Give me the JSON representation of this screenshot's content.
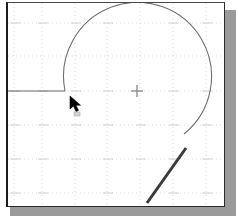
{
  "window": {
    "title": "CAD Drawing Area",
    "background_color": "#ffffff",
    "border_color": "#1c1c1c",
    "shadow_color": "#9a9a9a"
  },
  "grid": {
    "label": "construction-grid",
    "color": "#d9d9d9",
    "style": "dotted",
    "visible": true,
    "vertical_positions": [
      12,
      40,
      73,
      105,
      138,
      171,
      204
    ],
    "horizontal_positions": [
      22,
      55,
      90,
      124,
      158,
      192
    ]
  },
  "geometry": {
    "arc": {
      "name": "circular-arc",
      "color": "#6e6e6e",
      "stroke_width": 1,
      "center_x": 136,
      "center_y": 90,
      "radius": 74,
      "start_angle_deg": 180,
      "end_angle_deg": 45
    },
    "horizontal_line": {
      "name": "horizontal-construction-line",
      "color": "#6a6a6a",
      "stroke_width": 1,
      "x1": 5,
      "y1": 90,
      "x2": 63,
      "y2": 90
    },
    "diagonal_line": {
      "name": "diagonal-line",
      "color": "#3a3a3a",
      "stroke_width": 3,
      "x1": 145,
      "y1": 201,
      "x2": 184,
      "y2": 147
    },
    "center_marker": {
      "name": "center-crosshair-marker",
      "color": "#8f8f8f",
      "x": 135,
      "y": 90,
      "size": 13
    }
  },
  "cursor": {
    "name": "arrow-cursor",
    "x": 63,
    "y": 94,
    "color": "#000000"
  }
}
